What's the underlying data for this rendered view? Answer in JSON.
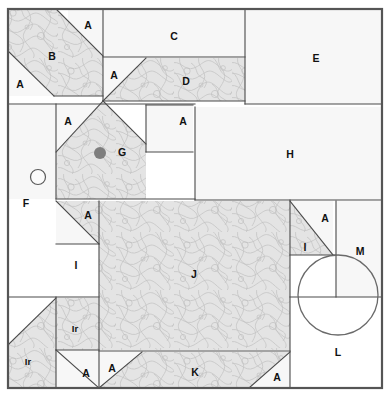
{
  "figure": {
    "kind": "site-plan-diagram",
    "canvas": {
      "width": 392,
      "height": 397
    },
    "frame": {
      "x": 8,
      "y": 9,
      "width": 374,
      "height": 379,
      "stroke": "#555555"
    },
    "palette": {
      "shaded_fill": "#e3e3e3",
      "plain_fill": "#f7f7f7",
      "line": "#4a4a4a",
      "label_text": "#111111",
      "dot_fill": "#7e7e7e",
      "background": "#ffffff"
    }
  },
  "regions": [
    {
      "id": "r01",
      "label": "A",
      "name": "region-a-top-left-upper",
      "fill": "plain",
      "points": "103,10 103,57 68,57 68,10",
      "label_at": [
        88,
        26
      ]
    },
    {
      "id": "r02",
      "label": "B",
      "name": "region-b",
      "fill": "shaded",
      "points": "9,10 57,10 103,56 103,96 54,96 9,52",
      "label_at": [
        52,
        57
      ]
    },
    {
      "id": "r03",
      "label": "A",
      "name": "region-a-left-upper",
      "fill": "plain",
      "points": "9,52 54,96 9,96",
      "label_at": [
        20,
        85
      ]
    },
    {
      "id": "r04",
      "label": "C",
      "name": "region-c",
      "fill": "plain",
      "points": "103,10 245,10 245,57 103,57",
      "label_at": [
        174,
        37
      ]
    },
    {
      "id": "r05",
      "label": "A",
      "name": "region-a-mid-upper",
      "fill": "plain",
      "points": "103,58 146,58 103,101",
      "label_at": [
        114,
        76
      ]
    },
    {
      "id": "r06",
      "label": "D",
      "name": "region-d",
      "fill": "shaded",
      "points": "146,58 245,58 245,101 103,101",
      "label_at": [
        186,
        82
      ]
    },
    {
      "id": "r07",
      "label": "E",
      "name": "region-e",
      "fill": "plain",
      "points": "245,10 382,10 382,104 245,104",
      "label_at": [
        316,
        59
      ]
    },
    {
      "id": "r08",
      "label": "A",
      "name": "region-a-g-left",
      "fill": "plain",
      "points": "56,105 103,105 56,152",
      "label_at": [
        68,
        122
      ]
    },
    {
      "id": "r09",
      "label": "G",
      "name": "region-g",
      "fill": "shaded",
      "points": "103,101 146,144 146,199 56,199 56,152",
      "label_at": [
        122,
        153
      ]
    },
    {
      "id": "r10",
      "label": "A",
      "name": "region-a-g-right",
      "fill": "plain",
      "points": "146,105 193,105 193,152 146,152",
      "label_at": [
        183,
        122
      ]
    },
    {
      "id": "r11",
      "label": "F",
      "name": "region-f",
      "fill": "plain",
      "points": "9,105 56,105 56,199 9,199",
      "label_at": [
        26,
        204
      ]
    },
    {
      "id": "r12",
      "label": "H",
      "name": "region-h",
      "fill": "plain",
      "points": "195,107 382,107 382,200 195,200",
      "label_at": [
        290,
        155
      ]
    },
    {
      "id": "r13",
      "label": "A",
      "name": "region-a-i-upper",
      "fill": "shaded",
      "points": "56,201 99,201 99,244 56,244",
      "label_at": [
        88,
        216
      ]
    },
    {
      "id": "r14",
      "label": "I",
      "name": "region-i-left",
      "fill": "plain",
      "points": "56,201 99,244 56,244 56,297 56,297",
      "label_at": [
        76,
        266
      ]
    },
    {
      "id": "r15",
      "label": "J",
      "name": "region-j",
      "fill": "shaded",
      "points": "99,201 290,201 290,350 99,350",
      "label_at": [
        194,
        275
      ]
    },
    {
      "id": "r16",
      "label": "A",
      "name": "region-a-i-right",
      "fill": "plain",
      "points": "290,201 333,201 333,255 290,255",
      "label_at": [
        325,
        219
      ]
    },
    {
      "id": "r17",
      "label": "I",
      "name": "region-i-right",
      "fill": "shaded",
      "points": "290,201 333,255 290,255 290,297",
      "label_at": [
        305,
        248
      ]
    },
    {
      "id": "r18",
      "label": "M",
      "name": "region-m",
      "fill": "plain",
      "points": "336,201 382,201 382,297 336,297",
      "label_at": [
        360,
        252
      ]
    },
    {
      "id": "r19",
      "label": "Ir",
      "name": "region-ir-right",
      "fill": "shaded",
      "points": "56,298 99,298 99,350 56,350",
      "label_at": [
        75,
        329
      ]
    },
    {
      "id": "r20",
      "label": "Ir",
      "name": "region-ir-left",
      "fill": "shaded",
      "points": "9,344 56,298 56,388 9,388",
      "label_at": [
        28,
        362
      ]
    },
    {
      "id": "r21",
      "label": "A",
      "name": "region-a-ir-bottom",
      "fill": "plain",
      "points": "56,350 99,350 99,388 56,388",
      "label_at": [
        86,
        374
      ]
    },
    {
      "id": "r22",
      "label": "A",
      "name": "region-a-k-left",
      "fill": "plain",
      "points": "99,352 142,352 99,388",
      "label_at": [
        112,
        369
      ]
    },
    {
      "id": "r23",
      "label": "K",
      "name": "region-k",
      "fill": "shaded",
      "points": "142,352 290,352 290,388 99,388",
      "label_at": [
        195,
        373
      ]
    },
    {
      "id": "r24",
      "label": "A",
      "name": "region-a-k-right",
      "fill": "plain",
      "points": "290,352 290,388 249,388",
      "label_at": [
        277,
        378
      ]
    },
    {
      "id": "r25",
      "label": "L",
      "name": "region-l",
      "fill": "none",
      "points": "",
      "label_at": [
        338,
        353
      ]
    }
  ],
  "markers": {
    "open_circle": {
      "name": "marker-open-circle",
      "cx": 38,
      "cy": 177,
      "r": 7.5
    },
    "solid_dot": {
      "name": "marker-solid-dot",
      "cx": 100,
      "cy": 153,
      "r": 6.0
    },
    "large_circle": {
      "name": "marker-large-circle",
      "cx": 338,
      "cy": 295,
      "r": 40.0
    }
  },
  "dividers": [
    {
      "name": "divider-c-d",
      "x1": 103,
      "y1": 57,
      "x2": 245,
      "y2": 57
    },
    {
      "name": "divider-d-bottom",
      "x1": 103,
      "y1": 101,
      "x2": 245,
      "y2": 101
    },
    {
      "name": "divider-e-left",
      "x1": 245,
      "y1": 10,
      "x2": 245,
      "y2": 104
    },
    {
      "name": "divider-e-bottom",
      "x1": 245,
      "y1": 104,
      "x2": 382,
      "y2": 104
    },
    {
      "name": "divider-b-right",
      "x1": 103,
      "y1": 10,
      "x2": 103,
      "y2": 101
    },
    {
      "name": "divider-row2-top",
      "x1": 9,
      "y1": 104,
      "x2": 195,
      "y2": 104
    },
    {
      "name": "divider-f-right",
      "x1": 56,
      "y1": 104,
      "x2": 56,
      "y2": 199
    },
    {
      "name": "divider-a-g-right",
      "x1": 146,
      "y1": 105,
      "x2": 146,
      "y2": 152
    },
    {
      "name": "divider-ag-top",
      "x1": 146,
      "y1": 105,
      "x2": 193,
      "y2": 105
    },
    {
      "name": "divider-ag-bottom",
      "x1": 146,
      "y1": 152,
      "x2": 193,
      "y2": 152
    },
    {
      "name": "divider-h-left",
      "x1": 195,
      "y1": 107,
      "x2": 195,
      "y2": 200
    },
    {
      "name": "divider-h-bottom",
      "x1": 195,
      "y1": 200,
      "x2": 382,
      "y2": 200
    },
    {
      "name": "divider-g-bottom",
      "x1": 56,
      "y1": 199,
      "x2": 195,
      "y2": 199
    },
    {
      "name": "divider-j-left",
      "x1": 99,
      "y1": 201,
      "x2": 99,
      "y2": 388
    },
    {
      "name": "divider-j-right",
      "x1": 290,
      "y1": 200,
      "x2": 290,
      "y2": 388
    },
    {
      "name": "divider-i-bottom",
      "x1": 9,
      "y1": 297,
      "x2": 99,
      "y2": 297
    },
    {
      "name": "divider-iright-bot",
      "x1": 290,
      "y1": 297,
      "x2": 382,
      "y2": 297
    },
    {
      "name": "divider-m-left",
      "x1": 336,
      "y1": 201,
      "x2": 336,
      "y2": 297
    },
    {
      "name": "divider-ir-bottom",
      "x1": 56,
      "y1": 350,
      "x2": 99,
      "y2": 350
    },
    {
      "name": "divider-k-top",
      "x1": 99,
      "y1": 351,
      "x2": 290,
      "y2": 351
    },
    {
      "name": "divider-iry-left",
      "x1": 56,
      "y1": 297,
      "x2": 56,
      "y2": 388
    },
    {
      "name": "divider-i-diag",
      "x1": 56,
      "y1": 201,
      "x2": 99,
      "y2": 244
    },
    {
      "name": "divider-i-hline",
      "x1": 56,
      "y1": 244,
      "x2": 99,
      "y2": 244
    },
    {
      "name": "divider-iright-diag",
      "x1": 290,
      "y1": 201,
      "x2": 333,
      "y2": 255
    },
    {
      "name": "divider-iright-h",
      "x1": 290,
      "y1": 255,
      "x2": 336,
      "y2": 255
    },
    {
      "name": "divider-b-diag",
      "x1": 57,
      "y1": 10,
      "x2": 103,
      "y2": 56
    },
    {
      "name": "divider-b-diag2",
      "x1": 9,
      "y1": 52,
      "x2": 54,
      "y2": 96
    },
    {
      "name": "divider-b-base",
      "x1": 54,
      "y1": 96,
      "x2": 103,
      "y2": 96
    },
    {
      "name": "divider-d-diag",
      "x1": 103,
      "y1": 101,
      "x2": 146,
      "y2": 58
    },
    {
      "name": "divider-g-diag-l",
      "x1": 56,
      "y1": 152,
      "x2": 103,
      "y2": 101
    },
    {
      "name": "divider-g-diag-r",
      "x1": 103,
      "y1": 101,
      "x2": 146,
      "y2": 144
    },
    {
      "name": "divider-ir-diag",
      "x1": 9,
      "y1": 344,
      "x2": 56,
      "y2": 298
    },
    {
      "name": "divider-a-ir-diag",
      "x1": 56,
      "y1": 350,
      "x2": 99,
      "y2": 388
    },
    {
      "name": "divider-k-diag-l",
      "x1": 99,
      "y1": 388,
      "x2": 142,
      "y2": 352
    },
    {
      "name": "divider-k-diag-r",
      "x1": 249,
      "y1": 388,
      "x2": 290,
      "y2": 352
    }
  ],
  "legend_labels": [
    "A",
    "B",
    "C",
    "D",
    "E",
    "F",
    "G",
    "H",
    "I",
    "Ir",
    "J",
    "K",
    "L",
    "M"
  ]
}
